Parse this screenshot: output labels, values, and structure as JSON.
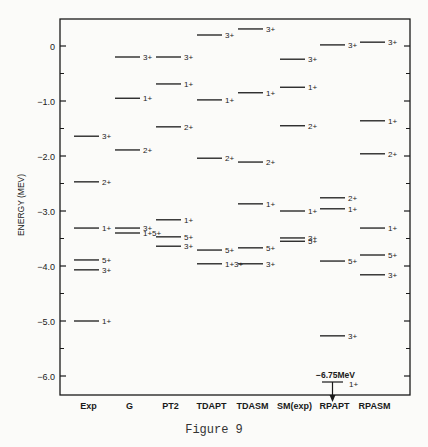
{
  "chart_data": {
    "type": "level-scheme",
    "title": "",
    "caption": "Figure 9",
    "ylabel": "ENERGY (MEV)",
    "xlabel": "",
    "ylim": [
      -6.6,
      0.55
    ],
    "yticks": [
      {
        "value": 0,
        "label": "0"
      },
      {
        "value": -1.0,
        "label": "-1.0"
      },
      {
        "value": -2.0,
        "label": "-2.0"
      },
      {
        "value": -3.0,
        "label": "-3.0"
      },
      {
        "value": -4.0,
        "label": "-4.0"
      },
      {
        "value": -5.0,
        "label": "-5.0"
      },
      {
        "value": -6.0,
        "label": "-6.0"
      }
    ],
    "minor_ticks": [
      -0.5,
      -1.5,
      -2.5,
      -3.5,
      -4.5,
      -5.5
    ],
    "grid": false,
    "categories": [
      "Exp",
      "G",
      "PT2",
      "TDAPT",
      "TDASM",
      "SM(exp)",
      "RPAPT",
      "RPASM"
    ],
    "series": [
      {
        "name": "Exp",
        "levels": [
          {
            "E": -1.64,
            "label": "3+"
          },
          {
            "E": -2.47,
            "label": "2+"
          },
          {
            "E": -3.31,
            "label": "1+"
          },
          {
            "E": -3.89,
            "label": "5+"
          },
          {
            "E": -4.07,
            "label": "3+"
          },
          {
            "E": -5.0,
            "label": "1+"
          }
        ]
      },
      {
        "name": "G",
        "levels": [
          {
            "E": -0.2,
            "label": "3+"
          },
          {
            "E": -0.95,
            "label": "1+"
          },
          {
            "E": -1.89,
            "label": "2+"
          },
          {
            "E": -3.31,
            "label": "3+"
          },
          {
            "E": -3.4,
            "label": "1+5+"
          }
        ]
      },
      {
        "name": "PT2",
        "levels": [
          {
            "E": -0.2,
            "label": "3+"
          },
          {
            "E": -0.69,
            "label": "1+"
          },
          {
            "E": -1.47,
            "label": "2+"
          },
          {
            "E": -3.16,
            "label": "1+"
          },
          {
            "E": -3.47,
            "label": "5+"
          },
          {
            "E": -3.64,
            "label": "3+"
          }
        ]
      },
      {
        "name": "TDAPT",
        "levels": [
          {
            "E": 0.2,
            "label": "3+"
          },
          {
            "E": -0.98,
            "label": "1+"
          },
          {
            "E": -2.04,
            "label": "2+"
          },
          {
            "E": -3.71,
            "label": "5+"
          },
          {
            "E": -3.96,
            "label": "1+3+"
          }
        ]
      },
      {
        "name": "TDASM",
        "levels": [
          {
            "E": 0.31,
            "label": "3+"
          },
          {
            "E": -0.85,
            "label": "1+"
          },
          {
            "E": -2.11,
            "label": "2+"
          },
          {
            "E": -2.87,
            "label": "1+"
          },
          {
            "E": -3.67,
            "label": "5+"
          },
          {
            "E": -3.96,
            "label": "3+"
          }
        ]
      },
      {
        "name": "SM(exp)",
        "levels": [
          {
            "E": -0.24,
            "label": "3+"
          },
          {
            "E": -0.75,
            "label": "1+"
          },
          {
            "E": -1.45,
            "label": "2+"
          },
          {
            "E": -3.0,
            "label": "1+"
          },
          {
            "E": -3.49,
            "label": "3+"
          },
          {
            "E": -3.55,
            "label": "5+"
          }
        ]
      },
      {
        "name": "RPAPT",
        "levels": [
          {
            "E": 0.02,
            "label": "3+"
          },
          {
            "E": -2.76,
            "label": "2+"
          },
          {
            "E": -2.96,
            "label": "1+"
          },
          {
            "E": -3.91,
            "label": "5+"
          },
          {
            "E": -5.27,
            "label": "3+"
          },
          {
            "E": -6.75,
            "label": "1+",
            "offscale": true,
            "annotation": "-6.75MeV"
          }
        ]
      },
      {
        "name": "RPASM",
        "levels": [
          {
            "E": 0.07,
            "label": "3+"
          },
          {
            "E": -1.36,
            "label": "1+"
          },
          {
            "E": -1.96,
            "label": "2+"
          },
          {
            "E": -3.31,
            "label": "1+"
          },
          {
            "E": -3.8,
            "label": "5+"
          },
          {
            "E": -4.16,
            "label": "3+"
          }
        ]
      }
    ]
  },
  "colors": {
    "ink": "#1a1a1a",
    "paper": "#fbfbf9"
  }
}
